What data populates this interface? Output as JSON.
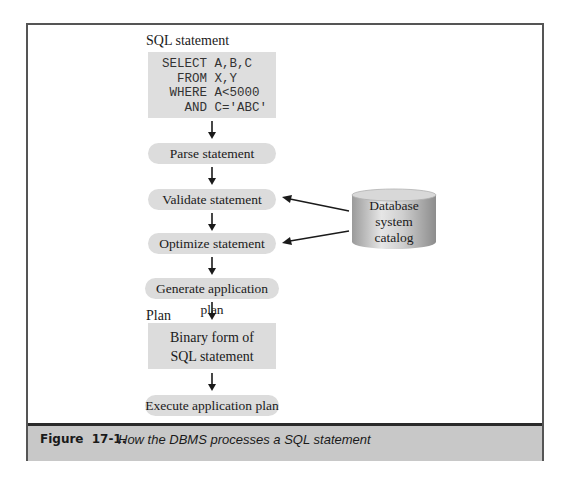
{
  "figure": {
    "number": "Figure 17-1.",
    "caption": "How the DBMS processes a SQL statement"
  },
  "diagram": {
    "sql_label": "SQL statement",
    "sql_lines": [
      "SELECT A,B,C",
      "  FROM X,Y",
      " WHERE A<5000",
      "   AND C='ABC'"
    ],
    "steps": [
      "Parse statement",
      "Validate statement",
      "Optimize statement",
      "Generate application plan"
    ],
    "plan_label": "Plan",
    "plan_box": [
      "Binary form of",
      "SQL statement"
    ],
    "final_step": "Execute application plan",
    "catalog": {
      "lines": [
        "Database",
        "system",
        "catalog"
      ],
      "feeds_into": [
        "Validate statement",
        "Optimize statement"
      ]
    }
  },
  "colors": {
    "box_fill": "#dcdcdc",
    "caption_bar": "#c8c8c8",
    "frame_border": "#555555",
    "text": "#1a1a1a"
  }
}
